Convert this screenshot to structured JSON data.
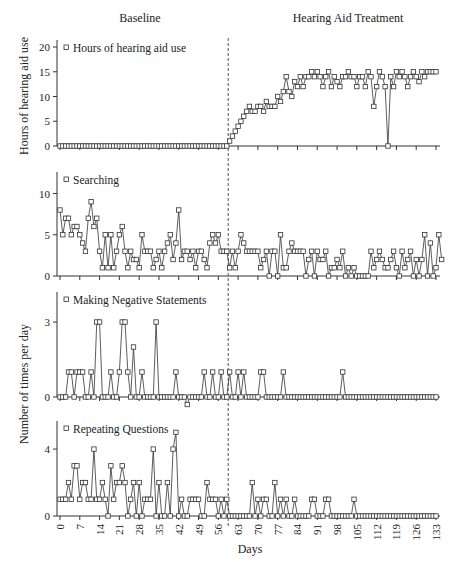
{
  "figure": {
    "phase_labels": [
      "Baseline",
      "Hearing Aid Treatment"
    ],
    "shared_ylabel": "Number of times per day",
    "xlabel": "Days",
    "phase_change_day": 59.5
  },
  "colors": {
    "line": "#333333",
    "marker_fill": "#ffffff",
    "axis": "#333333",
    "phase_line": "#555555"
  },
  "chart_data": [
    {
      "type": "line",
      "title": "Hours of hearing aid use",
      "legend": "Hours of hearing aid use",
      "xlabel": "Days",
      "ylabel": "Hours of hearing aid use",
      "ylim": [
        0,
        20
      ],
      "yticks": [
        0,
        5,
        10,
        15,
        20
      ],
      "x_range": [
        0,
        133
      ],
      "xticks": [
        0,
        7,
        14,
        21,
        28,
        35,
        42,
        49,
        56,
        63,
        70,
        77,
        84,
        91,
        98,
        105,
        112,
        119,
        126,
        133
      ],
      "grid": false,
      "values": [
        0,
        0,
        0,
        0,
        0,
        0,
        0,
        0,
        0,
        0,
        0,
        0,
        0,
        0,
        0,
        0,
        0,
        0,
        0,
        0,
        0,
        0,
        0,
        0,
        0,
        0,
        0,
        0,
        0,
        0,
        0,
        0,
        0,
        0,
        0,
        0,
        0,
        0,
        0,
        0,
        0,
        0,
        0,
        0,
        0,
        0,
        0,
        0,
        0,
        0,
        0,
        0,
        0,
        0,
        0,
        0,
        0,
        0,
        0,
        0,
        1,
        2,
        3,
        4,
        5,
        6,
        7,
        8,
        7,
        7,
        8,
        8,
        7,
        9,
        8,
        8,
        8,
        10,
        9,
        11,
        14,
        11,
        10,
        13,
        12,
        14,
        12,
        14,
        14,
        15,
        14,
        15,
        14,
        12,
        14,
        15,
        12,
        14,
        13,
        12,
        14,
        14,
        15,
        14,
        14,
        12,
        14,
        14,
        12,
        15,
        14,
        8,
        12,
        15,
        14,
        12,
        0,
        14,
        12,
        15,
        14,
        15,
        14,
        12,
        14,
        15,
        14,
        13,
        15,
        14,
        15,
        15,
        15,
        15
      ]
    },
    {
      "type": "line",
      "title": "Searching",
      "legend": "Searching",
      "ylim": [
        0,
        12
      ],
      "yticks": [
        0,
        5,
        10
      ],
      "x_range": [
        0,
        133
      ],
      "grid": false,
      "values": [
        8,
        5,
        7,
        7,
        5,
        6,
        6,
        5,
        4,
        3,
        7,
        9,
        6,
        7,
        3,
        1,
        5,
        1,
        5,
        1,
        3,
        5,
        6,
        3,
        1,
        3,
        2,
        2,
        1,
        5,
        3,
        3,
        3,
        1,
        2,
        3,
        1,
        3,
        4,
        5,
        2,
        4,
        8,
        2,
        3,
        3,
        2,
        3,
        1,
        3,
        3,
        2,
        1,
        4,
        5,
        4,
        5,
        3,
        3,
        3,
        1,
        3,
        1,
        3,
        5,
        4,
        3,
        3,
        3,
        3,
        3,
        1,
        2,
        3,
        0,
        3,
        3,
        0,
        5,
        1,
        1,
        3,
        4,
        3,
        3,
        3,
        3,
        0,
        2,
        3,
        0,
        3,
        2,
        2,
        3,
        0,
        1,
        1,
        2,
        1,
        3,
        0,
        1,
        0,
        1,
        0,
        0,
        0,
        0,
        0,
        3,
        1,
        2,
        3,
        2,
        1,
        1,
        2,
        3,
        1,
        0,
        3,
        1,
        2,
        3,
        0,
        2,
        0,
        2,
        5,
        0,
        4,
        0,
        1,
        5,
        2
      ]
    },
    {
      "type": "line",
      "title": "Making Negative Statements",
      "legend": "Making Negative Statements",
      "ylim": [
        0,
        4
      ],
      "yticks": [
        0,
        3
      ],
      "x_range": [
        0,
        133
      ],
      "grid": false,
      "values": [
        0,
        0,
        0,
        1,
        1,
        0,
        1,
        1,
        1,
        0,
        0,
        1,
        0,
        3,
        3,
        0,
        0,
        0,
        1,
        0,
        0,
        1,
        3,
        3,
        1,
        0,
        2,
        0,
        0,
        1,
        0,
        0,
        0,
        0,
        3,
        0,
        0,
        0,
        0,
        0,
        0,
        1,
        0,
        0,
        0,
        -0.3,
        0,
        0,
        0,
        0,
        0,
        1,
        0,
        0,
        1,
        0,
        0,
        1,
        0,
        0,
        1,
        0,
        0,
        1,
        0,
        1,
        0,
        0,
        0,
        0,
        0,
        1,
        1,
        0,
        0,
        0,
        0,
        0,
        0,
        1,
        0,
        0,
        0,
        0,
        0,
        0,
        0,
        0,
        0,
        0,
        0,
        0,
        0,
        0,
        0,
        0,
        0,
        0,
        0,
        0,
        1,
        0,
        0,
        0,
        0,
        0,
        0,
        0,
        0,
        0,
        0,
        0,
        0,
        0,
        0,
        0,
        0,
        0,
        0,
        0,
        0,
        0,
        0,
        0,
        0,
        0,
        0,
        0,
        0,
        0,
        0,
        0,
        0,
        0
      ]
    },
    {
      "type": "line",
      "title": "Repeating Questions",
      "legend": "Repeating Questions",
      "ylim": [
        0,
        5.5
      ],
      "yticks": [
        0,
        4
      ],
      "x_range": [
        0,
        133
      ],
      "xticks": [
        0,
        7,
        14,
        21,
        28,
        35,
        42,
        49,
        56,
        63,
        70,
        77,
        84,
        91,
        98,
        105,
        112,
        119,
        126,
        133
      ],
      "xlabel": "Days",
      "grid": false,
      "values": [
        1,
        1,
        1,
        2,
        1,
        3,
        3,
        1,
        2,
        2,
        1,
        1,
        4,
        1,
        1,
        2,
        1,
        0,
        3,
        1,
        2,
        2,
        3,
        2,
        0,
        1,
        2,
        0,
        2,
        0,
        1,
        1,
        1,
        4,
        0,
        2,
        0,
        0,
        2,
        0,
        4,
        5,
        0,
        1,
        0,
        0,
        1,
        1,
        1,
        1,
        0,
        0,
        2,
        1,
        1,
        1,
        0,
        1,
        0,
        1,
        0,
        0,
        0,
        0,
        0,
        0,
        0,
        0,
        2,
        0,
        1,
        0,
        1,
        1,
        0,
        0,
        2,
        0,
        1,
        0,
        1,
        0,
        0,
        1,
        0,
        0,
        0,
        0,
        0,
        1,
        1,
        0,
        0,
        0,
        1,
        1,
        0,
        0,
        0,
        0,
        0,
        0,
        0,
        0,
        1,
        0,
        0,
        0,
        0,
        0,
        0,
        0,
        0,
        0,
        0,
        0,
        0,
        0,
        0,
        0,
        0,
        0,
        0,
        0,
        0,
        0,
        0,
        0,
        0,
        0,
        0,
        0,
        0,
        0
      ]
    }
  ]
}
